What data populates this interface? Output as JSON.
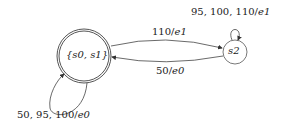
{
  "diagram": {
    "type": "state-machine",
    "states": [
      {
        "id": "s01",
        "label": "{s0, s1}",
        "accepting": true
      },
      {
        "id": "s2",
        "label": "s2",
        "accepting": false
      }
    ],
    "transitions": [
      {
        "from": "s01",
        "to": "s2",
        "label": "110/e1"
      },
      {
        "from": "s2",
        "to": "s01",
        "label": "50/e0"
      },
      {
        "from": "s2",
        "to": "s2",
        "label": "95, 100, 110/e1"
      },
      {
        "from": "s01",
        "to": "s01",
        "label": "50, 95, 100/e0"
      }
    ]
  },
  "labels": {
    "state_s01": "{s0, s1}",
    "state_s2": "s2",
    "t_s01_s2_in": "110/",
    "t_s01_s2_out": "e1",
    "t_s2_s01_in": "50/",
    "t_s2_s01_out": "e0",
    "t_s2_loop_in": "95, 100, 110/",
    "t_s2_loop_out": "e1",
    "t_s01_loop_in": "50, 95, 100/",
    "t_s01_loop_out": "e0"
  }
}
